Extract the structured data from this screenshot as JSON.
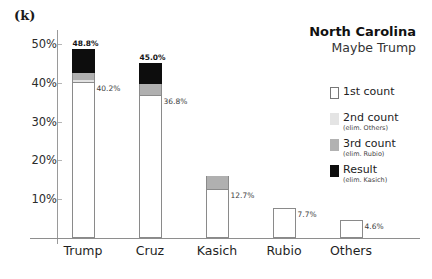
{
  "panel": {
    "label": "(k)"
  },
  "titles": {
    "main": "North Carolina",
    "sub": "Maybe Trump"
  },
  "legend": {
    "items": [
      {
        "name": "1st count",
        "note": "",
        "color": "#ffffff",
        "swatch": "sw-1st"
      },
      {
        "name": "2nd count",
        "note": "(elim. Others)",
        "color": "#e4e4e4",
        "swatch": "sw-2nd"
      },
      {
        "name": "3rd count",
        "note": "(elim. Rubio)",
        "color": "#b2b2b2",
        "swatch": "sw-3rd"
      },
      {
        "name": "Result",
        "note": "(elim. Kasich)",
        "color": "#0d0d0d",
        "swatch": "sw-result"
      }
    ]
  },
  "chart_data": {
    "type": "bar",
    "title": "North Carolina",
    "subtitle": "Maybe Trump",
    "xlabel": "",
    "ylabel": "",
    "ylim": [
      0,
      53
    ],
    "grid": false,
    "legend_position": "right",
    "ticks": [
      "10%",
      "20%",
      "30%",
      "40%",
      "50%"
    ],
    "tick_values": [
      10,
      20,
      30,
      40,
      50
    ],
    "categories": [
      "Trump",
      "Cruz",
      "Kasich",
      "Rubio",
      "Others"
    ],
    "series": [
      {
        "name": "1st count",
        "color": "#ffffff",
        "values": [
          40.2,
          36.8,
          12.7,
          7.7,
          4.6
        ]
      },
      {
        "name": "2nd count",
        "color": "#e2e2e2",
        "values": [
          40.8,
          36.8,
          12.7,
          7.7,
          0
        ]
      },
      {
        "name": "3rd count",
        "color": "#b0b0b0",
        "values": [
          42.4,
          39.6,
          16.1,
          0,
          0
        ]
      },
      {
        "name": "Result",
        "color": "#0d0d0d",
        "values": [
          48.8,
          45.0,
          0,
          0,
          0
        ]
      }
    ],
    "bar_labels_top": [
      "48.8%",
      "45.0%",
      "",
      "",
      ""
    ],
    "bar_labels_side": [
      "40.2%",
      "36.8%",
      "12.7%",
      "7.7%",
      "4.6%"
    ],
    "bars": [
      {
        "category": "Trump",
        "first": 40.2,
        "second": 40.8,
        "third": 42.4,
        "result": 48.8,
        "top_label": "48.8%",
        "side_label": "40.2%"
      },
      {
        "category": "Cruz",
        "first": 36.8,
        "second": 36.8,
        "third": 39.6,
        "result": 45.0,
        "top_label": "45.0%",
        "side_label": "36.8%"
      },
      {
        "category": "Kasich",
        "first": 12.7,
        "second": 12.7,
        "third": 16.1,
        "result": 16.1,
        "top_label": "",
        "side_label": "12.7%"
      },
      {
        "category": "Rubio",
        "first": 7.7,
        "second": 7.7,
        "third": 7.7,
        "result": 7.7,
        "top_label": "",
        "side_label": "7.7%"
      },
      {
        "category": "Others",
        "first": 4.6,
        "second": 4.6,
        "third": 4.6,
        "result": 4.6,
        "top_label": "",
        "side_label": "4.6%"
      }
    ]
  },
  "layout": {
    "plot_left": 58,
    "plot_right": 420,
    "baseline_y": 238,
    "value_per_px": 0.2577,
    "bar_width": 23,
    "bar_centers": [
      83,
      150,
      217,
      284,
      351
    ]
  }
}
